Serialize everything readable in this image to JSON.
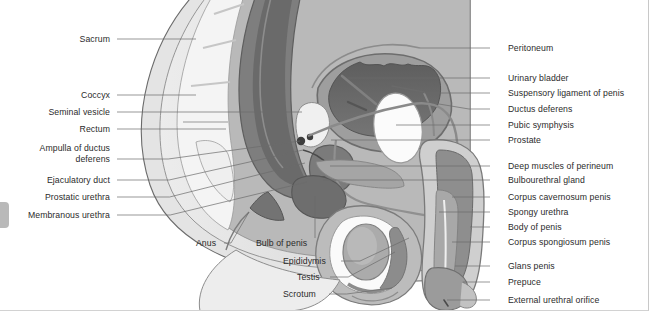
{
  "figure": {
    "orientation": "sagittal",
    "style": "grayscale medical illustration",
    "colors": {
      "background": "#ffffff",
      "skin_outer": "#e9e9e9",
      "skin_mid": "#d6d6d6",
      "muscle": "#9a9a9a",
      "muscle_dark": "#7d7d7d",
      "organ_dark": "#6f6f6f",
      "organ_darkest": "#4d4d4d",
      "bone_light": "#f2f2f2",
      "bone_white": "#fbfbfb",
      "outline": "#5a5a5a",
      "outline_dark": "#3a3a3a",
      "label_text": "#2b2b2b",
      "leader_line": "#6b6b6b",
      "edge_tab": "#b9b9b9"
    }
  },
  "labels_left": [
    {
      "text": "Sacrum",
      "x": 110,
      "y": 34,
      "lx": 117,
      "ly": 39,
      "tx": 196,
      "ty": 39
    },
    {
      "text": "Coccyx",
      "x": 110,
      "y": 90,
      "lx": 117,
      "ly": 95,
      "tx": 196,
      "ty": 95
    },
    {
      "text": "Seminal vesicle",
      "x": 110,
      "y": 107,
      "lx": 117,
      "ly": 112,
      "tx": 302,
      "ty": 112
    },
    {
      "text": "Rectum",
      "x": 110,
      "y": 124,
      "lx": 117,
      "ly": 129,
      "tx": 226,
      "ty": 129
    },
    {
      "text": "Ampulla of ductus",
      "x": 110,
      "y": 143,
      "lx": null,
      "ly": null,
      "tx": null,
      "ty": null
    },
    {
      "text": "deferens",
      "x": 110,
      "y": 154,
      "lx": 117,
      "ly": 159,
      "tx": 300,
      "ty": 141
    },
    {
      "text": "Ejaculatory duct",
      "x": 110,
      "y": 175,
      "lx": 117,
      "ly": 180,
      "tx": 303,
      "ty": 150
    },
    {
      "text": "Prostatic urethra",
      "x": 110,
      "y": 192,
      "lx": 117,
      "ly": 197,
      "tx": 305,
      "ty": 163
    },
    {
      "text": "Membranous urethra",
      "x": 110,
      "y": 210,
      "lx": 117,
      "ly": 215,
      "tx": 307,
      "ty": 182
    }
  ],
  "labels_right": [
    {
      "text": "Peritoneum",
      "x": 508,
      "y": 43,
      "lx": 490,
      "ly": 48,
      "tx": 420,
      "ty": 48
    },
    {
      "text": "Urinary bladder",
      "x": 508,
      "y": 73,
      "lx": 490,
      "ly": 78,
      "tx": 348,
      "ty": 78
    },
    {
      "text": "Suspensory ligament of penis",
      "x": 508,
      "y": 88,
      "lx": 490,
      "ly": 93,
      "tx": 424,
      "ty": 93
    },
    {
      "text": "Ductus deferens",
      "x": 508,
      "y": 104,
      "lx": 490,
      "ly": 109,
      "tx": 415,
      "ty": 100
    },
    {
      "text": "Pubic symphysis",
      "x": 508,
      "y": 120,
      "lx": 490,
      "ly": 125,
      "tx": 396,
      "ty": 125
    },
    {
      "text": "Prostate",
      "x": 508,
      "y": 135,
      "lx": 490,
      "ly": 140,
      "tx": 331,
      "ty": 140
    },
    {
      "text": "Deep muscles of perineum",
      "x": 508,
      "y": 161,
      "lx": 490,
      "ly": 166,
      "tx": 330,
      "ty": 166
    },
    {
      "text": "Bulbourethral gland",
      "x": 508,
      "y": 175,
      "lx": 490,
      "ly": 180,
      "tx": 323,
      "ty": 180
    },
    {
      "text": "Corpus cavernosum penis",
      "x": 508,
      "y": 192,
      "lx": 490,
      "ly": 197,
      "tx": 452,
      "ty": 197
    },
    {
      "text": "Spongy urethra",
      "x": 508,
      "y": 207,
      "lx": 490,
      "ly": 212,
      "tx": 439,
      "ty": 212
    },
    {
      "text": "Body of penis",
      "x": 508,
      "y": 222,
      "lx": 490,
      "ly": 227,
      "tx": 470,
      "ty": 227
    },
    {
      "text": "Corpus spongiosum penis",
      "x": 508,
      "y": 237,
      "lx": 490,
      "ly": 242,
      "tx": 452,
      "ty": 242
    },
    {
      "text": "Glans penis",
      "x": 508,
      "y": 261,
      "lx": 490,
      "ly": 266,
      "tx": 455,
      "ty": 266
    },
    {
      "text": "Prepuce",
      "x": 508,
      "y": 277,
      "lx": 490,
      "ly": 282,
      "tx": 463,
      "ty": 282
    },
    {
      "text": "External urethral orifice",
      "x": 508,
      "y": 295,
      "lx": 490,
      "ly": 300,
      "tx": 447,
      "ty": 300
    }
  ],
  "labels_bottom": [
    {
      "text": "Anus",
      "x": 196,
      "y": 238,
      "lx": 224,
      "ly": 243,
      "tx": 249,
      "ty": 212
    },
    {
      "text": "Bulb of penis",
      "x": 256,
      "y": 238,
      "lx": 315,
      "ly": 238,
      "tx": 315,
      "ty": 196
    },
    {
      "text": "Epididymis",
      "x": 283,
      "y": 256,
      "lx": 341,
      "ly": 261,
      "tx": 409,
      "ty": 238
    },
    {
      "text": "Testis",
      "x": 297,
      "y": 272,
      "lx": 330,
      "ly": 277,
      "tx": 395,
      "ty": 252
    },
    {
      "text": "Scrotum",
      "x": 283,
      "y": 289,
      "lx": 329,
      "ly": 294,
      "tx": 392,
      "ty": 288
    }
  ]
}
